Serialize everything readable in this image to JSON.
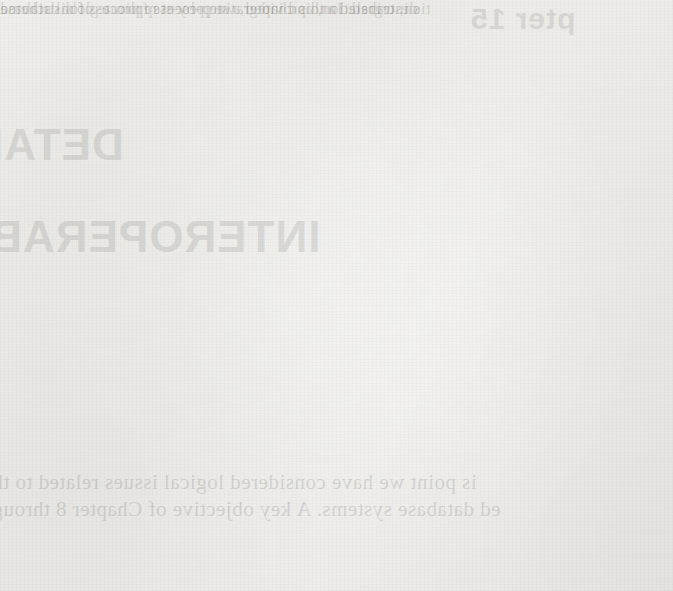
{
  "page": {
    "kind": "scanned-book-page",
    "background_color": "#f2f1ee",
    "ink_color": "#0a0a0a"
  },
  "diagram": {
    "nodes": [
      {
        "id": "db1",
        "label": "Database 1",
        "shape": "stadium",
        "column": 1,
        "row": 1
      },
      {
        "id": "db2",
        "label": "Database 2",
        "shape": "stadium",
        "column": 2,
        "row": 1
      },
      {
        "id": "dbn",
        "label": "Database",
        "shape": "stadium",
        "column": 3,
        "row": 1
      },
      {
        "id": "tr1",
        "label": "Translator 1",
        "shape": "rect",
        "column": 1,
        "row": 2
      },
      {
        "id": "tr2",
        "label": "Translator 2",
        "shape": "rect",
        "column": 2,
        "row": 2
      },
      {
        "id": "trn",
        "label": "Translator n",
        "shape": "rect",
        "column": 3,
        "row": 2
      },
      {
        "id": "ins1",
        "label": "InS",
        "subscript": "1",
        "shape": "stadium",
        "column": 1,
        "row": 3
      },
      {
        "id": "ins2",
        "label": "InS",
        "subscript": "2",
        "shape": "stadium",
        "column": 2,
        "row": 3
      },
      {
        "id": "insn",
        "label": "InS",
        "subscript": "n",
        "shape": "stadium",
        "column": 3,
        "row": 3
      },
      {
        "id": "integrator",
        "label": "Integrator",
        "shape": "rect",
        "column": 0,
        "row": 4
      },
      {
        "id": "gcs",
        "label": "GCS",
        "shape": "stadium",
        "column": 0,
        "row": 5
      }
    ],
    "ellipses": [
      {
        "id": "ellipsis-row-1",
        "label": "...",
        "row": 1
      },
      {
        "id": "ellipsis-row-2",
        "label": "...",
        "row": 2
      },
      {
        "id": "ellipsis-row-3",
        "label": "...",
        "row": 3
      }
    ],
    "edges": [
      {
        "from": "db1",
        "to": "tr1",
        "style": "arrow-down"
      },
      {
        "from": "db2",
        "to": "tr2",
        "style": "arrow-down"
      },
      {
        "from": "dbn",
        "to": "trn",
        "style": "arrow-down"
      },
      {
        "from": "tr1",
        "to": "ins1",
        "style": "arrow-down"
      },
      {
        "from": "tr2",
        "to": "ins2",
        "style": "arrow-down"
      },
      {
        "from": "trn",
        "to": "insn",
        "style": "arrow-down"
      },
      {
        "from": "ins1",
        "to": "integrator",
        "style": "arrow-diagonal-right"
      },
      {
        "from": "ins2",
        "to": "integrator",
        "style": "arrow-down"
      },
      {
        "from": "insn",
        "to": "integrator",
        "style": "arrow-diagonal-left"
      },
      {
        "from": "integrator",
        "to": "gcs",
        "style": "arrow-down"
      }
    ]
  },
  "bleed_through": {
    "note": "faint mirrored text showing through from the reverse side of the page",
    "chapter_heading": "pter 15",
    "heading_detail": "DETAI",
    "heading_interop": "INTEROPERABI",
    "body_lines": [
      "is point we have considered   logical   issues related to  th",
      "ed database systems.  A key objective of  Chapter 8  throug",
      "s integrated and provided a step-by-step process for database",
      "described.  In this chapter, we present replicate of distributed",
      "tion, translation, and integration process from a global schema"
    ]
  }
}
